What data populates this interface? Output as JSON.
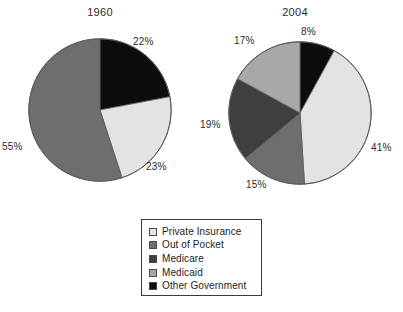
{
  "chart_data": [
    {
      "type": "pie",
      "title": "1960",
      "categories": [
        "Private Insurance",
        "Out of Pocket",
        "Medicare",
        "Medicaid",
        "Other Government"
      ],
      "values": [
        23,
        55,
        0,
        0,
        22
      ],
      "labels": [
        "23%",
        "55%",
        "",
        "",
        "22%"
      ],
      "slice_order_clockwise_from_top": [
        "Other Government",
        "Private Insurance",
        "Out of Pocket"
      ],
      "colors": [
        "#e3e3e3",
        "#6e6e6e",
        "#3f3f3f",
        "#a8a8a8",
        "#0d0d0d"
      ],
      "unit": "percent",
      "legend_position": "bottom-center",
      "grid": false
    },
    {
      "type": "pie",
      "title": "2004",
      "categories": [
        "Private Insurance",
        "Out of Pocket",
        "Medicare",
        "Medicaid",
        "Other Government"
      ],
      "values": [
        41,
        15,
        19,
        17,
        8
      ],
      "labels": [
        "41%",
        "15%",
        "19%",
        "17%",
        "8%"
      ],
      "slice_order_clockwise_from_top": [
        "Other Government",
        "Private Insurance",
        "Out of Pocket",
        "Medicare",
        "Medicaid"
      ],
      "colors": [
        "#e3e3e3",
        "#6e6e6e",
        "#3f3f3f",
        "#a8a8a8",
        "#0d0d0d"
      ],
      "unit": "percent",
      "legend_position": "bottom-center",
      "grid": false
    }
  ],
  "titles": {
    "left": "1960",
    "right": "2004"
  },
  "labels_1960": {
    "other_government": "22%",
    "private_insurance": "23%",
    "out_of_pocket": "55%"
  },
  "labels_2004": {
    "other_government": "8%",
    "private_insurance": "41%",
    "out_of_pocket": "15%",
    "medicare": "19%",
    "medicaid": "17%"
  },
  "legend": {
    "items": [
      {
        "label": "Private Insurance",
        "color": "#e3e3e3"
      },
      {
        "label": "Out of Pocket",
        "color": "#6e6e6e"
      },
      {
        "label": "Medicare",
        "color": "#3f3f3f"
      },
      {
        "label": "Medicaid",
        "color": "#a8a8a8"
      },
      {
        "label": "Other Government",
        "color": "#0d0d0d"
      }
    ]
  }
}
